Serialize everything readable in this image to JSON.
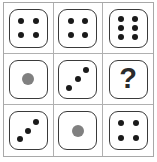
{
  "puzzle": {
    "title": "Dice matrix puzzle",
    "type": "3x3-matrix-reasoning",
    "unknown_label": "?",
    "colors": {
      "pip_black": "#1a1a1a",
      "pip_gray": "#808080",
      "die_border": "#3a3a3a",
      "grid_line": "#b0b0b0",
      "frame_border": "#a8a8a8",
      "background": "#ffffff"
    },
    "grid": {
      "rows": 3,
      "cols": 3
    },
    "cells": [
      {
        "id": "cell-r1c1",
        "row": 1,
        "col": 1,
        "kind": "die",
        "face_name": "four",
        "pip_count": 4,
        "pattern": "four-corners",
        "pips": [
          {
            "x": 30,
            "y": 30,
            "color": "black",
            "size": "small"
          },
          {
            "x": 70,
            "y": 30,
            "color": "black",
            "size": "small"
          },
          {
            "x": 30,
            "y": 70,
            "color": "black",
            "size": "small"
          },
          {
            "x": 70,
            "y": 70,
            "color": "black",
            "size": "small"
          }
        ]
      },
      {
        "id": "cell-r1c2",
        "row": 1,
        "col": 2,
        "kind": "die",
        "face_name": "four",
        "pip_count": 4,
        "pattern": "four-corners",
        "pips": [
          {
            "x": 30,
            "y": 30,
            "color": "black",
            "size": "small"
          },
          {
            "x": 70,
            "y": 30,
            "color": "black",
            "size": "small"
          },
          {
            "x": 30,
            "y": 70,
            "color": "black",
            "size": "small"
          },
          {
            "x": 70,
            "y": 70,
            "color": "black",
            "size": "small"
          }
        ]
      },
      {
        "id": "cell-r1c3",
        "row": 1,
        "col": 3,
        "kind": "die",
        "face_name": "six",
        "pip_count": 6,
        "pattern": "two-columns-of-three",
        "pips": [
          {
            "x": 31,
            "y": 25,
            "color": "black",
            "size": "small"
          },
          {
            "x": 69,
            "y": 25,
            "color": "black",
            "size": "small"
          },
          {
            "x": 31,
            "y": 50,
            "color": "black",
            "size": "small"
          },
          {
            "x": 69,
            "y": 50,
            "color": "black",
            "size": "small"
          },
          {
            "x": 31,
            "y": 75,
            "color": "black",
            "size": "small"
          },
          {
            "x": 69,
            "y": 75,
            "color": "black",
            "size": "small"
          }
        ]
      },
      {
        "id": "cell-r2c1",
        "row": 2,
        "col": 1,
        "kind": "die",
        "face_name": "one",
        "pip_count": 1,
        "pattern": "center-large-gray",
        "pips": [
          {
            "x": 50,
            "y": 50,
            "color": "gray",
            "size": "large"
          }
        ]
      },
      {
        "id": "cell-r2c2",
        "row": 2,
        "col": 2,
        "kind": "die",
        "face_name": "three",
        "pip_count": 3,
        "pattern": "anti-diagonal",
        "pips": [
          {
            "x": 72,
            "y": 26,
            "color": "black",
            "size": "small"
          },
          {
            "x": 50,
            "y": 50,
            "color": "black",
            "size": "small"
          },
          {
            "x": 27,
            "y": 74,
            "color": "black",
            "size": "small"
          }
        ]
      },
      {
        "id": "cell-r2c3",
        "row": 2,
        "col": 3,
        "kind": "question",
        "face_name": "unknown",
        "pip_count": 0,
        "pattern": "question-mark",
        "pips": []
      },
      {
        "id": "cell-r3c1",
        "row": 3,
        "col": 1,
        "kind": "die",
        "face_name": "three",
        "pip_count": 3,
        "pattern": "anti-diagonal",
        "pips": [
          {
            "x": 72,
            "y": 26,
            "color": "black",
            "size": "small"
          },
          {
            "x": 50,
            "y": 50,
            "color": "black",
            "size": "small"
          },
          {
            "x": 27,
            "y": 74,
            "color": "black",
            "size": "small"
          }
        ]
      },
      {
        "id": "cell-r3c2",
        "row": 3,
        "col": 2,
        "kind": "die",
        "face_name": "one",
        "pip_count": 1,
        "pattern": "center-large-gray",
        "pips": [
          {
            "x": 50,
            "y": 50,
            "color": "gray",
            "size": "large"
          }
        ]
      },
      {
        "id": "cell-r3c3",
        "row": 3,
        "col": 3,
        "kind": "die",
        "face_name": "four",
        "pip_count": 4,
        "pattern": "four-corners",
        "pips": [
          {
            "x": 30,
            "y": 30,
            "color": "black",
            "size": "small"
          },
          {
            "x": 70,
            "y": 30,
            "color": "black",
            "size": "small"
          },
          {
            "x": 30,
            "y": 70,
            "color": "black",
            "size": "small"
          },
          {
            "x": 70,
            "y": 70,
            "color": "black",
            "size": "small"
          }
        ]
      }
    ]
  }
}
